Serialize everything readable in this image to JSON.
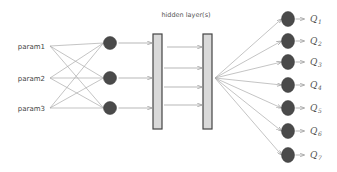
{
  "diagram": {
    "title": "hidden layer(s)",
    "inputs": [
      {
        "label": "param1"
      },
      {
        "label": "param2"
      },
      {
        "label": "param3"
      }
    ],
    "hidden_layers": 2,
    "hidden_connections": 4,
    "outputs": [
      {
        "symbol": "Q",
        "subscript": "1"
      },
      {
        "symbol": "Q",
        "subscript": "2"
      },
      {
        "symbol": "Q",
        "subscript": "3"
      },
      {
        "symbol": "Q",
        "subscript": "4"
      },
      {
        "symbol": "Q",
        "subscript": "5"
      },
      {
        "symbol": "Q",
        "subscript": "6"
      },
      {
        "symbol": "Q",
        "subscript": "7"
      }
    ],
    "colors": {
      "node": "#4a4a4a",
      "bar_fill": "#d9d9d9",
      "edge": "#aaaaaa"
    }
  }
}
